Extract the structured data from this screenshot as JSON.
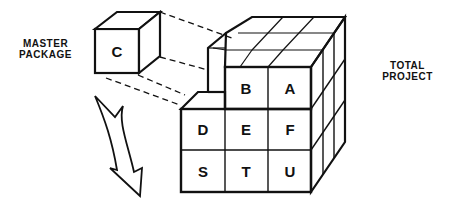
{
  "labels": {
    "master_package_line1": "MASTER",
    "master_package_line2": "PACKAGE",
    "total_project_line1": "TOTAL",
    "total_project_line2": "PROJECT"
  },
  "master_cube": {
    "letter": "C"
  },
  "project_cube": {
    "top_row": [
      "B",
      "A"
    ],
    "middle_row": [
      "D",
      "E",
      "F"
    ],
    "bottom_row": [
      "S",
      "T",
      "U"
    ]
  },
  "colors": {
    "line": "#111111",
    "background": "#ffffff"
  }
}
